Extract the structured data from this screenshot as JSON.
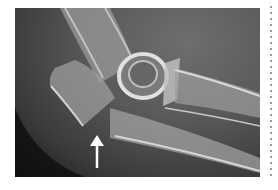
{
  "figure": {
    "type": "radiograph",
    "annotation": {
      "icon": "arrow-up-icon",
      "color": "#ffffff"
    },
    "colors": {
      "background": "#ffffff",
      "film_dark": "#1a1a1a",
      "film_mid": "#5a5a5a",
      "bone": "#d8d8d8"
    }
  }
}
